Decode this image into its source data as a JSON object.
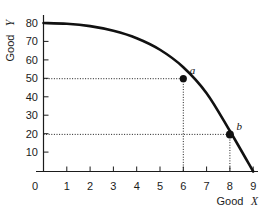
{
  "chart_data": {
    "type": "line",
    "title": "",
    "xlabel": "Good X",
    "ylabel": "Good Y",
    "xlim": [
      0,
      9.6
    ],
    "ylim": [
      0,
      86
    ],
    "grid": false,
    "legend_position": "none",
    "x_ticks": [
      "0",
      "1",
      "2",
      "3",
      "4",
      "5",
      "6",
      "7",
      "8",
      "9"
    ],
    "x_tick_values": [
      0,
      1,
      2,
      3,
      4,
      5,
      6,
      7,
      8,
      9
    ],
    "y_ticks": [
      "10",
      "20",
      "30",
      "40",
      "50",
      "60",
      "70",
      "80"
    ],
    "y_tick_values": [
      10,
      20,
      30,
      40,
      50,
      60,
      70,
      80
    ],
    "y_origin_label": "0",
    "series": [
      {
        "name": "Production possibilities frontier",
        "type": "curve",
        "x": [
          0,
          1,
          2,
          3,
          4,
          5,
          6,
          7,
          8,
          9
        ],
        "values": [
          80,
          79.6,
          78.3,
          75.8,
          71.8,
          65.6,
          56.2,
          42.2,
          21.8,
          0
        ]
      }
    ],
    "annotations": [
      {
        "label": "a",
        "x": 6,
        "y": 50,
        "marker": "filled-circle",
        "guides": [
          "horizontal-to-y-axis",
          "vertical-to-x-axis"
        ]
      },
      {
        "label": "b",
        "x": 8,
        "y": 20,
        "marker": "filled-circle",
        "guides": [
          "horizontal-to-y-axis",
          "vertical-to-x-axis"
        ]
      }
    ]
  },
  "axis": {
    "y_title": "Good Y",
    "y_title_word": "Good",
    "y_title_symbol": "Y",
    "x_title": "Good X",
    "x_title_word": "Good",
    "x_title_symbol": "X"
  },
  "points": {
    "a": {
      "label": "a"
    },
    "b": {
      "label": "b"
    }
  },
  "ticks": {
    "x": {
      "t0": "0",
      "t1": "1",
      "t2": "2",
      "t3": "3",
      "t4": "4",
      "t5": "5",
      "t6": "6",
      "t7": "7",
      "t8": "8",
      "t9": "9"
    },
    "y": {
      "t10": "10",
      "t20": "20",
      "t30": "30",
      "t40": "40",
      "t50": "50",
      "t60": "60",
      "t70": "70",
      "t80": "80"
    }
  },
  "colors": {
    "curve": "#111111",
    "axis": "#1b1b1b",
    "guide": "#1b1b1b",
    "background": "#ffffff"
  }
}
